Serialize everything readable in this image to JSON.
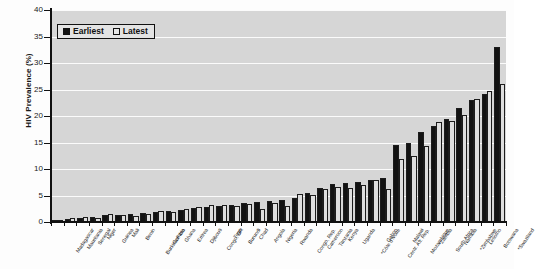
{
  "chart_data": {
    "type": "bar",
    "title": "",
    "xlabel": "",
    "ylabel": "HIV Prevalence (%)",
    "ylim": [
      0,
      40
    ],
    "yticks": [
      0,
      5,
      10,
      15,
      20,
      25,
      30,
      35,
      40
    ],
    "grid": true,
    "legend_position": "top-left",
    "legend": [
      "Earliest",
      "Latest"
    ],
    "categories": [
      "Madagascar",
      "Mauritania",
      "Senegal",
      "Niger",
      "Guinea",
      "Mali",
      "Benin",
      "Burkina Faso",
      "Gambia",
      "Ghana",
      "Eritrea",
      "Djibouti",
      "Congo, DR",
      "Togo",
      "Burundi",
      "Chad",
      "Angola",
      "Nigeria",
      "Rwanda",
      "Congo, Rep.",
      "Cameroon",
      "Tanzania",
      "Kenya",
      "Uganda",
      "*Côte d'Ivoire",
      "Gabon",
      "Centr. Afr. Rep.",
      "Malawi",
      "Mozambique",
      "*Zambia",
      "South Africa",
      "Namibia",
      "*Zimbabwe",
      "Lesotho",
      "Botswana",
      "*Swaziland"
    ],
    "series": [
      {
        "name": "Earliest",
        "values": [
          0.2,
          0.6,
          0.8,
          0.9,
          1.3,
          1.4,
          1.5,
          1.7,
          1.8,
          2.1,
          2.3,
          2.6,
          2.9,
          3.1,
          3.3,
          3.5,
          3.7,
          3.9,
          4.2,
          4.5,
          5.4,
          6.5,
          7.1,
          7.3,
          7.5,
          8.0,
          8.3,
          14.5,
          15.0,
          17.0,
          18.2,
          19.5,
          21.5,
          23.0,
          24.2,
          33.0
        ]
      },
      {
        "name": "Latest",
        "values": [
          0.2,
          0.7,
          0.9,
          0.8,
          1.5,
          1.3,
          1.2,
          1.6,
          2.0,
          1.9,
          2.4,
          2.8,
          3.2,
          3.3,
          3.0,
          3.4,
          2.5,
          3.6,
          3.0,
          5.3,
          5.1,
          6.2,
          6.7,
          6.4,
          7.0,
          7.9,
          6.2,
          11.9,
          12.5,
          14.3,
          18.8,
          19.0,
          20.1,
          23.2,
          24.8,
          26.1
        ]
      }
    ]
  }
}
